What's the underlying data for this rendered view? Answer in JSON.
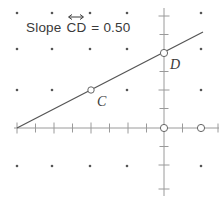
{
  "figure": {
    "title_text_prefix": "Slope ",
    "segment_name": "CD",
    "equals_and_value": " = 0.50",
    "slope_value": "0.50",
    "overline_arrow_icon": "double-headed-arrow-icon"
  },
  "points": [
    {
      "name": "C",
      "label": "C",
      "px": 91,
      "py": 90,
      "graph_x": -4,
      "graph_y": 2
    },
    {
      "name": "D",
      "label": "D",
      "px": 164,
      "py": 53,
      "graph_x": 0,
      "graph_y": 4
    },
    {
      "name": "origin",
      "label": "",
      "px": 164,
      "py": 128,
      "graph_x": 0,
      "graph_y": 0
    },
    {
      "name": "x-axis-point",
      "label": "",
      "px": 201,
      "py": 128,
      "graph_x": 2,
      "graph_y": 0
    }
  ],
  "line": {
    "name": "line-CD",
    "x1": 17,
    "y1": 128,
    "x2": 203,
    "y2": 32,
    "slope": "0.50"
  },
  "axes": {
    "origin_px": 164,
    "origin_py": 128,
    "tick_spacing": 18.5,
    "x_axis_left": 14,
    "x_axis_right": 219,
    "y_axis_top": 8,
    "y_axis_bottom": 196
  },
  "grid": {
    "dot_columns_px": [
      17,
      52,
      90,
      127,
      201
    ],
    "dot_rows_px": [
      13,
      49,
      90,
      166
    ],
    "dot_color": "#555555"
  },
  "colors": {
    "axis": "#9a9a9a",
    "line": "#555555",
    "text": "#3a3a3a",
    "point_stroke": "#666666",
    "background": "#ffffff"
  }
}
